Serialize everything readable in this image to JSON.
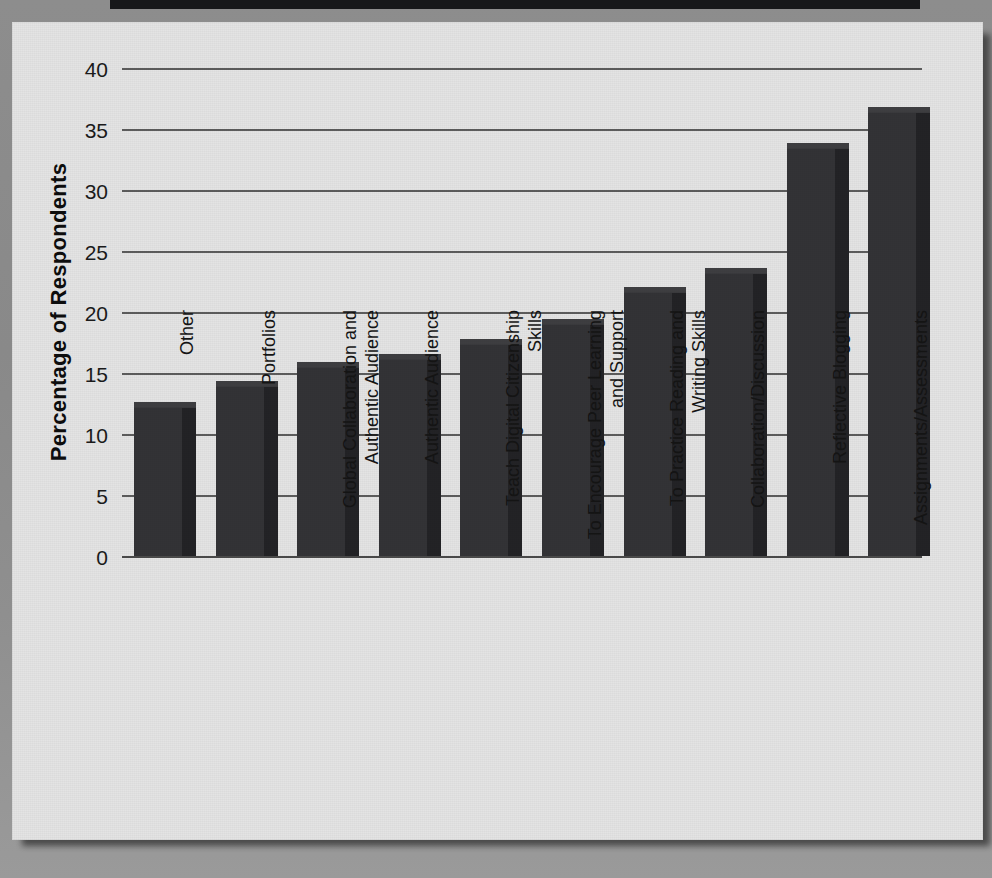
{
  "chart_data": {
    "type": "bar",
    "title": "",
    "xlabel": "",
    "ylabel": "Percentage of Respondents",
    "ylim": [
      0,
      40
    ],
    "ytick_step": 5,
    "yticks": [
      40,
      35,
      30,
      25,
      20,
      15,
      10,
      5,
      0
    ],
    "grid": "horizontal",
    "legend": "none",
    "orientation": "vertical",
    "bar_color": "#2b2b2d",
    "panel_color": "#e4e4e4",
    "page_color": "#8d8d8d",
    "categories": [
      "Other",
      "Portfolios",
      "Global Collaboration and\nAuthentic Audience",
      "Authentic Audience",
      "Teach Digital Citizenship\nSkills",
      "To Encourage Peer Learning\nand Support",
      "To Practice Reading and\nWriting Skills",
      "Collaboration/Discussion",
      "Reflective Blogging",
      "Assignments/Assessments"
    ],
    "values": [
      12.3,
      14.0,
      15.6,
      16.2,
      17.5,
      19.1,
      21.7,
      23.3,
      33.5,
      36.5
    ],
    "series": [
      {
        "name": "Percentage of Respondents",
        "values": [
          12.3,
          14.0,
          15.6,
          16.2,
          17.5,
          19.1,
          21.7,
          23.3,
          33.5,
          36.5
        ]
      }
    ]
  }
}
